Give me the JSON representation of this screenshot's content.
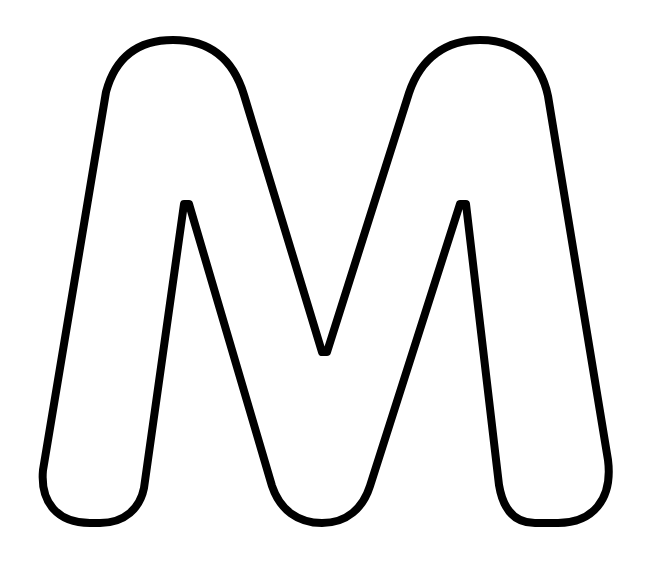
{
  "image": {
    "subject": "Outline letter M",
    "letter": "M",
    "background_color": "#ffffff",
    "stroke_color": "#000000",
    "fill_color": "#ffffff",
    "stroke_width": 8
  }
}
